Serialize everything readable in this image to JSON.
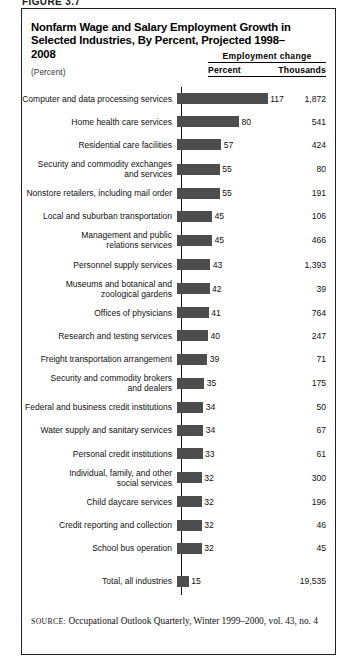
{
  "figure": {
    "caption": "FIGURE 3.7"
  },
  "chart_title": "Nonfarm Wage and Salary Employment Growth in Selected Industries, By Percent, Projected 1998–2008",
  "unit_note": "(Percent)",
  "columns": {
    "group_header": "Employment change",
    "percent": "Percent",
    "thousands": "Thousands"
  },
  "source": {
    "label": "SOURCE:",
    "text": " Occupational Outlook Quarterly, Winter 1999–2000, vol. 43, no. 4"
  },
  "style": {
    "bar_color": "#4d4d4d",
    "border_color": "#222222",
    "text_color": "#111111"
  },
  "chart_data": {
    "type": "bar",
    "orientation": "horizontal",
    "title": "Nonfarm Wage and Salary Employment Growth in Selected Industries, By Percent, Projected 1998–2008",
    "xlabel": "Percent",
    "ylabel": "",
    "xlim": [
      0,
      120
    ],
    "grid": false,
    "legend": "none",
    "value_labels": true,
    "categories": [
      "Computer and data processing services",
      "Home health care services",
      "Residential care facilities",
      "Security and commodity exchanges and services",
      "Nonstore retailers, including mail order",
      "Local and suburban transportation",
      "Management and public relations services",
      "Personnel supply services",
      "Museums and botanical and zoological gardens",
      "Offices of physicians",
      "Research and testing services",
      "Freight transportation arrangement",
      "Security and commodity brokers and dealers",
      "Federal and business credit institutions",
      "Water supply and sanitary services",
      "Personal credit institutions",
      "Individual, family, and other social services",
      "Child daycare services",
      "Credit reporting and collection",
      "School bus operation",
      "Total, all industries"
    ],
    "values": [
      117,
      80,
      57,
      55,
      55,
      45,
      45,
      43,
      42,
      41,
      40,
      39,
      35,
      34,
      34,
      33,
      32,
      32,
      32,
      32,
      15
    ],
    "series": [
      {
        "name": "Percent",
        "values": [
          117,
          80,
          57,
          55,
          55,
          45,
          45,
          43,
          42,
          41,
          40,
          39,
          35,
          34,
          34,
          33,
          32,
          32,
          32,
          32,
          15
        ]
      },
      {
        "name": "Thousands",
        "values": [
          1872,
          541,
          424,
          80,
          191,
          106,
          466,
          1393,
          39,
          764,
          247,
          71,
          175,
          50,
          67,
          61,
          300,
          196,
          46,
          45,
          19535
        ]
      }
    ],
    "rows": [
      {
        "label_lines": [
          "Computer and data processing services"
        ],
        "percent": "117",
        "percent_value": 117,
        "thousands": "1,872"
      },
      {
        "label_lines": [
          "Home health care services"
        ],
        "percent": "80",
        "percent_value": 80,
        "thousands": "541"
      },
      {
        "label_lines": [
          "Residential care facilities"
        ],
        "percent": "57",
        "percent_value": 57,
        "thousands": "424"
      },
      {
        "label_lines": [
          "Security and commodity exchanges",
          "and services"
        ],
        "percent": "55",
        "percent_value": 55,
        "thousands": "80"
      },
      {
        "label_lines": [
          "Nonstore retailers, including mail order"
        ],
        "percent": "55",
        "percent_value": 55,
        "thousands": "191"
      },
      {
        "label_lines": [
          "Local and suburban transportation"
        ],
        "percent": "45",
        "percent_value": 45,
        "thousands": "106"
      },
      {
        "label_lines": [
          "Management and public",
          "relations services"
        ],
        "percent": "45",
        "percent_value": 45,
        "thousands": "466"
      },
      {
        "label_lines": [
          "Personnel supply services"
        ],
        "percent": "43",
        "percent_value": 43,
        "thousands": "1,393"
      },
      {
        "label_lines": [
          "Museums and botanical and",
          "zoological gardens"
        ],
        "percent": "42",
        "percent_value": 42,
        "thousands": "39"
      },
      {
        "label_lines": [
          "Offices of physicians"
        ],
        "percent": "41",
        "percent_value": 41,
        "thousands": "764"
      },
      {
        "label_lines": [
          "Research and testing services"
        ],
        "percent": "40",
        "percent_value": 40,
        "thousands": "247"
      },
      {
        "label_lines": [
          "Freight transportation arrangement"
        ],
        "percent": "39",
        "percent_value": 39,
        "thousands": "71"
      },
      {
        "label_lines": [
          "Security and commodity brokers",
          "and dealers"
        ],
        "percent": "35",
        "percent_value": 35,
        "thousands": "175"
      },
      {
        "label_lines": [
          "Federal and business credit institutions"
        ],
        "percent": "34",
        "percent_value": 34,
        "thousands": "50"
      },
      {
        "label_lines": [
          "Water supply and sanitary services"
        ],
        "percent": "34",
        "percent_value": 34,
        "thousands": "67"
      },
      {
        "label_lines": [
          "Personal credit institutions"
        ],
        "percent": "33",
        "percent_value": 33,
        "thousands": "61"
      },
      {
        "label_lines": [
          "Individual, family, and other",
          "social services"
        ],
        "percent": "32",
        "percent_value": 32,
        "thousands": "300"
      },
      {
        "label_lines": [
          "Child daycare services"
        ],
        "percent": "32",
        "percent_value": 32,
        "thousands": "196"
      },
      {
        "label_lines": [
          "Credit reporting and collection"
        ],
        "percent": "32",
        "percent_value": 32,
        "thousands": "46"
      },
      {
        "label_lines": [
          "School bus operation"
        ],
        "percent": "32",
        "percent_value": 32,
        "thousands": "45"
      },
      {
        "label_lines": [
          "Total, all industries"
        ],
        "percent": "15",
        "percent_value": 15,
        "thousands": "19,535"
      }
    ]
  }
}
